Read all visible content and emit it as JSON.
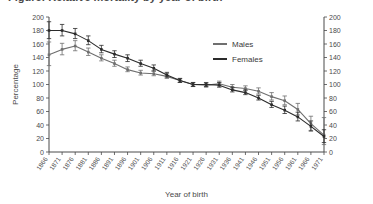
{
  "figure": {
    "title_cropped": "Figure: Relative mortality by year of birth",
    "axis_left_label": "Percentage",
    "axis_right_label": "Percentage",
    "axis_x_label": "Year of birth"
  },
  "legend": {
    "position": "top-right-inside",
    "entries": [
      {
        "label": "Males",
        "color": "#6f6f6f"
      },
      {
        "label": "Females",
        "color": "#2b2b2b"
      }
    ]
  },
  "chart_data": {
    "type": "line",
    "title": "",
    "xlabel": "Year of birth",
    "ylabel": "Percentage",
    "ylim": [
      0,
      200
    ],
    "ytick_step": 20,
    "yticks": [
      0,
      20,
      40,
      60,
      80,
      100,
      120,
      140,
      160,
      180,
      200
    ],
    "grid": false,
    "right_axis_mirrored": true,
    "error_bars": true,
    "categories": [
      "1866",
      "1871",
      "1876",
      "1881",
      "1886",
      "1891",
      "1896",
      "1901",
      "1906",
      "1911",
      "1916",
      "1921",
      "1926",
      "1931",
      "1936",
      "1941",
      "1946",
      "1951",
      "1956",
      "1961",
      "1966",
      "1971"
    ],
    "series": [
      {
        "name": "Males",
        "color": "#6f6f6f",
        "values": [
          144,
          152,
          157,
          148,
          139,
          131,
          122,
          117,
          116,
          112,
          106,
          100,
          99,
          101,
          96,
          94,
          90,
          82,
          76,
          63,
          42,
          25
        ],
        "err_low": [
          128,
          144,
          150,
          143,
          135,
          127,
          119,
          114,
          113,
          109,
          103,
          97,
          96,
          98,
          93,
          91,
          86,
          77,
          70,
          55,
          32,
          11
        ],
        "err_high": [
          163,
          161,
          165,
          154,
          144,
          136,
          126,
          121,
          120,
          116,
          109,
          103,
          102,
          105,
          100,
          98,
          95,
          88,
          83,
          72,
          53,
          51
        ]
      },
      {
        "name": "Females",
        "color": "#2b2b2b",
        "values": [
          180,
          180,
          175,
          165,
          152,
          145,
          139,
          131,
          124,
          114,
          106,
          100,
          100,
          99,
          92,
          88,
          80,
          70,
          62,
          52,
          38,
          23
        ],
        "err_low": [
          168,
          172,
          168,
          159,
          147,
          140,
          134,
          127,
          120,
          111,
          103,
          97,
          97,
          96,
          89,
          85,
          77,
          66,
          57,
          46,
          31,
          14
        ],
        "err_high": [
          193,
          189,
          183,
          172,
          158,
          150,
          144,
          136,
          129,
          118,
          109,
          103,
          103,
          103,
          96,
          92,
          84,
          75,
          68,
          59,
          46,
          33
        ]
      }
    ]
  }
}
